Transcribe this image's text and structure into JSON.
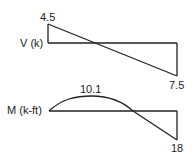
{
  "shear_diagram": {
    "axis_label": "V (k)",
    "max_positive_label": "4.5",
    "max_negative_label": "7.5",
    "values": {
      "start": 4.5,
      "end": -7.5
    }
  },
  "moment_diagram": {
    "axis_label": "M (k-ft)",
    "max_positive_label": "10.1",
    "max_negative_label": "18",
    "values": {
      "peak": 10.1,
      "end": -18
    }
  },
  "colors": {
    "line": "#222222",
    "background": "#ffffff"
  }
}
